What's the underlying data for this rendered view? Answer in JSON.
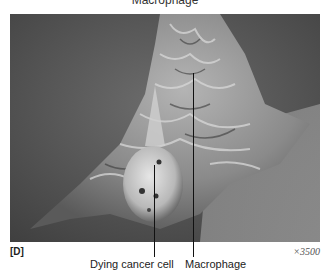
{
  "figure": {
    "top_label": "Macrophage",
    "panel_letter": "[D]",
    "magnification": "×3500",
    "labels": {
      "dying_cancer_cell": "Dying cancer cell",
      "macrophage": "Macrophage"
    },
    "image_description": "Scanning electron micrograph of a macrophage engulfing a dying cancer cell"
  }
}
